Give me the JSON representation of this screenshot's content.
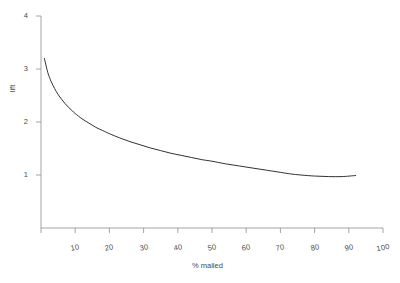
{
  "chart_data": {
    "type": "line",
    "title": "",
    "subtitle": "",
    "xlabel": "% mailed",
    "ylabel": "lift",
    "xlim": [
      0,
      100
    ],
    "ylim": [
      0,
      4
    ],
    "grid": false,
    "legend": null,
    "x_ticks": [
      10,
      20,
      30,
      40,
      50,
      60,
      70,
      80,
      90,
      100
    ],
    "x_tick_labels": [
      "10",
      "20",
      "30",
      "40",
      "50",
      "60",
      "70",
      "80",
      "90",
      "100"
    ],
    "y_ticks": [
      1,
      2,
      3,
      4
    ],
    "y_tick_labels": [
      "1",
      "2",
      "3",
      "4"
    ],
    "series": [
      {
        "name": "lift",
        "color": "#1a1a1a",
        "x": [
          1,
          2,
          3,
          4,
          5,
          6,
          7,
          8,
          9,
          10,
          12,
          14,
          16,
          18,
          20,
          23,
          26,
          29,
          32,
          35,
          38,
          41,
          44,
          47,
          50,
          54,
          58,
          62,
          66,
          70,
          73,
          76,
          80,
          84,
          88,
          92
        ],
        "y": [
          3.2,
          2.93,
          2.76,
          2.63,
          2.52,
          2.43,
          2.35,
          2.28,
          2.22,
          2.16,
          2.06,
          1.98,
          1.9,
          1.84,
          1.78,
          1.7,
          1.63,
          1.57,
          1.51,
          1.46,
          1.41,
          1.37,
          1.33,
          1.29,
          1.26,
          1.21,
          1.17,
          1.13,
          1.09,
          1.05,
          1.02,
          1.0,
          0.98,
          0.97,
          0.97,
          0.99
        ]
      }
    ],
    "axis_color": "#9a9a9a",
    "text_color": "#4a4a4a",
    "line_color": "#1a1a1a",
    "background": "#ffffff"
  }
}
